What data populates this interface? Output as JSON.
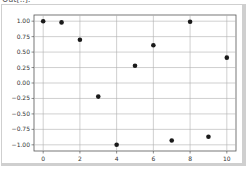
{
  "header": {
    "cut_off_label": "Out[..]:"
  },
  "chart_data": {
    "type": "scatter",
    "title": "",
    "xlabel": "",
    "ylabel": "",
    "x": [
      0,
      1,
      2,
      3,
      4,
      5,
      6,
      7,
      8,
      9,
      10
    ],
    "y": [
      1.0,
      0.98,
      0.7,
      -0.22,
      -1.0,
      0.28,
      0.61,
      -0.93,
      0.99,
      -0.87,
      0.41
    ],
    "xlim": [
      -0.5,
      10.5
    ],
    "ylim": [
      -1.1,
      1.1
    ],
    "xticks": [
      0,
      2,
      4,
      6,
      8,
      10
    ],
    "xtick_labels": [
      "0",
      "2",
      "4",
      "6",
      "8",
      "10"
    ],
    "yticks": [
      1.0,
      0.75,
      0.5,
      0.25,
      0.0,
      -0.25,
      -0.5,
      -0.75,
      -1.0
    ],
    "ytick_labels": [
      "1.00",
      "0.75",
      "0.50",
      "0.25",
      "0.00",
      "−0.25",
      "−0.50",
      "−0.75",
      "−1.00"
    ],
    "grid": true,
    "marker_color": "#1a1a1a",
    "legend": null
  }
}
